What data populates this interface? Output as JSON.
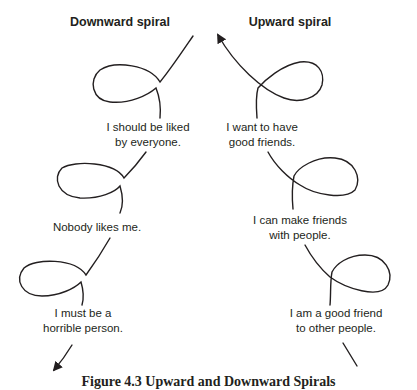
{
  "diagram": {
    "left": {
      "heading": "Downward spiral",
      "steps": [
        {
          "line1": "I should be liked",
          "line2": "by everyone."
        },
        {
          "line1": "Nobody likes me.",
          "line2": ""
        },
        {
          "line1": "I must be a",
          "line2": "horrible person."
        }
      ],
      "direction": "down"
    },
    "right": {
      "heading": "Upward spiral",
      "steps": [
        {
          "line1": "I want to have",
          "line2": "good friends."
        },
        {
          "line1": "I can make friends",
          "line2": "with people."
        },
        {
          "line1": "I am a good friend",
          "line2": "to other people."
        }
      ],
      "direction": "up"
    },
    "caption": "Figure 4.3   Upward and Downward Spirals",
    "stroke_color": "#231f20"
  }
}
